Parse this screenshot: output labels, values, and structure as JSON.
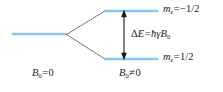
{
  "figure": {
    "kind": "energy-level-splitting-diagram",
    "background_color": "#ffffff",
    "level_line_color": "#8ec5e8",
    "branch_line_color": "#3a3a3a",
    "arrow_color": "#1a1a1a",
    "text_color": "#1a1a1a"
  },
  "levels": {
    "unsplit": {
      "label_text": "",
      "x1": 12,
      "x2": 66,
      "y": 34
    },
    "upper": {
      "x1": 105,
      "x2": 158,
      "y": 11,
      "quantum_number": {
        "symbol": "m",
        "subscript": "z",
        "operator": "=",
        "value": "−1/2"
      }
    },
    "lower": {
      "x1": 105,
      "x2": 158,
      "y": 59,
      "quantum_number": {
        "symbol": "m",
        "subscript": "z",
        "operator": "=",
        "value": "1/2"
      }
    }
  },
  "branches": {
    "vertex_x": 66,
    "vertex_y": 34,
    "end_x": 105,
    "upper_end_y": 11,
    "lower_end_y": 59,
    "style": "dotted"
  },
  "energy_gap": {
    "arrow": {
      "x": 124,
      "y_top": 11,
      "y_bottom": 59,
      "double_headed": true
    },
    "equation": {
      "delta": "Δ",
      "energy_symbol": "E",
      "operator": "=",
      "hbar": "ħ",
      "gamma": "γ",
      "field_symbol": "B",
      "field_subscript": "0"
    }
  },
  "axis_labels": {
    "left": {
      "field_symbol": "B",
      "subscript": "0",
      "operator": "=",
      "value": "0"
    },
    "right": {
      "field_symbol": "B",
      "subscript": "0",
      "operator": "≠",
      "value": "0"
    }
  }
}
